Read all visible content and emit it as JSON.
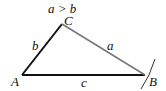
{
  "diagram": {
    "condition": "a > b",
    "vertices": {
      "A": "A",
      "B": "B",
      "C": "C"
    },
    "sides": {
      "a": "a",
      "b": "b",
      "c": "c"
    },
    "colors": {
      "line": "#111111",
      "side_a": "#777777"
    }
  }
}
